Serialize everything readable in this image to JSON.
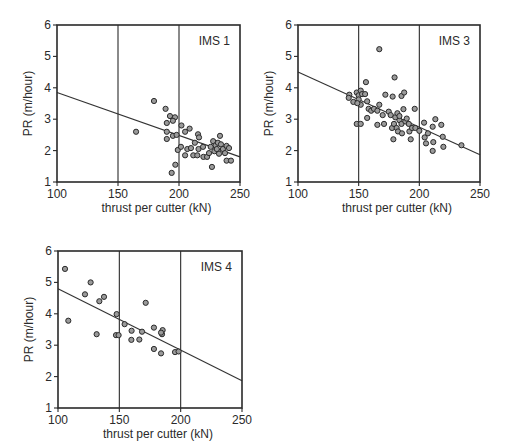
{
  "chart_data": [
    {
      "type": "scatter",
      "title": "IMS 1",
      "xlabel": "thrust per cutter (kN)",
      "ylabel": "PR (m/hour)",
      "xlim": [
        100,
        250
      ],
      "ylim": [
        1,
        6
      ],
      "xticks": [
        100,
        150,
        200,
        250
      ],
      "yticks": [
        1,
        2,
        3,
        4,
        5,
        6
      ],
      "xtick_labels": [
        "100",
        "150",
        "200",
        "250"
      ],
      "ytick_labels": [
        "1",
        "2",
        "3",
        "4",
        "5",
        "6"
      ],
      "vertical_gridlines": [
        150,
        200
      ],
      "label_position": "top-right",
      "regression_line": {
        "x": [
          100,
          250
        ],
        "y": [
          3.85,
          1.8
        ]
      },
      "points": [
        [
          164.8,
          2.6
        ],
        [
          179.5,
          3.58
        ],
        [
          189,
          3.33
        ],
        [
          192.6,
          3.1
        ],
        [
          190,
          2.88
        ],
        [
          196.7,
          3.06
        ],
        [
          195,
          2.95
        ],
        [
          190,
          2.6
        ],
        [
          190,
          2.37
        ],
        [
          195,
          2.47
        ],
        [
          198,
          2.5
        ],
        [
          199,
          2.02
        ],
        [
          201.6,
          2.12
        ],
        [
          202,
          2.8
        ],
        [
          197,
          1.55
        ],
        [
          194,
          1.29
        ],
        [
          205,
          2.6
        ],
        [
          208.7,
          2.7
        ],
        [
          205,
          1.85
        ],
        [
          206.8,
          2.05
        ],
        [
          209.8,
          2.08
        ],
        [
          211.7,
          1.85
        ],
        [
          215,
          1.85
        ],
        [
          213,
          2.25
        ],
        [
          215.6,
          2.52
        ],
        [
          216.4,
          2.42
        ],
        [
          216,
          2.05
        ],
        [
          220,
          1.8
        ],
        [
          223,
          1.8
        ],
        [
          226,
          2.12
        ],
        [
          227,
          1.48
        ],
        [
          228,
          2.3
        ],
        [
          229,
          1.98
        ],
        [
          230,
          2.17
        ],
        [
          231.9,
          2.25
        ],
        [
          232.8,
          1.9
        ],
        [
          233.6,
          2.47
        ],
        [
          234.4,
          2.2
        ],
        [
          231,
          2.05
        ],
        [
          236,
          2.05
        ],
        [
          237.7,
          1.92
        ],
        [
          239,
          2.15
        ],
        [
          241,
          2.08
        ],
        [
          239,
          1.68
        ],
        [
          242.6,
          1.68
        ],
        [
          224.6,
          1.92
        ],
        [
          219.7,
          2.12
        ]
      ]
    },
    {
      "type": "scatter",
      "title": "IMS 3",
      "xlabel": "thrust per cutter (kN)",
      "ylabel": "PR (m/hour)",
      "xlim": [
        100,
        250
      ],
      "ylim": [
        1,
        6
      ],
      "xticks": [
        100,
        150,
        200,
        250
      ],
      "yticks": [
        1,
        2,
        3,
        4,
        5,
        6
      ],
      "xtick_labels": [
        "100",
        "150",
        "200",
        "250"
      ],
      "ytick_labels": [
        "1",
        "2",
        "3",
        "4",
        "5",
        "6"
      ],
      "vertical_gridlines": [
        150,
        200
      ],
      "label_position": "top-right",
      "regression_line": {
        "x": [
          100,
          250
        ],
        "y": [
          4.5,
          1.87
        ]
      },
      "points": [
        [
          167,
          5.23
        ],
        [
          179.6,
          4.33
        ],
        [
          156,
          4.18
        ],
        [
          142.3,
          3.78
        ],
        [
          141.8,
          3.68
        ],
        [
          145.6,
          3.55
        ],
        [
          148.4,
          3.85
        ],
        [
          150,
          3.76
        ],
        [
          151.7,
          3.91
        ],
        [
          152.8,
          3.8
        ],
        [
          150,
          3.63
        ],
        [
          151.7,
          3.46
        ],
        [
          148.9,
          3.51
        ],
        [
          155.3,
          3.8
        ],
        [
          157,
          3.57
        ],
        [
          158.2,
          3.33
        ],
        [
          160.3,
          3.27
        ],
        [
          157,
          3.04
        ],
        [
          148.4,
          2.85
        ],
        [
          151.7,
          2.85
        ],
        [
          162.6,
          3.33
        ],
        [
          165.4,
          3.27
        ],
        [
          165.4,
          2.82
        ],
        [
          167,
          3.46
        ],
        [
          169.8,
          3.13
        ],
        [
          170.9,
          2.85
        ],
        [
          172,
          3.78
        ],
        [
          174.8,
          3.24
        ],
        [
          176.4,
          3.13
        ],
        [
          178,
          3.72
        ],
        [
          177.5,
          2.72
        ],
        [
          178.6,
          2.36
        ],
        [
          179.1,
          2.85
        ],
        [
          180.2,
          3.06
        ],
        [
          181.3,
          2.72
        ],
        [
          182.4,
          2.61
        ],
        [
          181.9,
          3.19
        ],
        [
          183.6,
          2.97
        ],
        [
          185.3,
          2.85
        ],
        [
          185.3,
          3.74
        ],
        [
          187.5,
          3.85
        ],
        [
          186.9,
          3.32
        ],
        [
          183.6,
          3.1
        ],
        [
          185.7,
          2.55
        ],
        [
          188.5,
          2.93
        ],
        [
          189.6,
          3.02
        ],
        [
          191.3,
          2.85
        ],
        [
          191.8,
          2.61
        ],
        [
          192.9,
          2.36
        ],
        [
          194,
          2.72
        ],
        [
          196.2,
          3.33
        ],
        [
          196.7,
          2.72
        ],
        [
          200,
          2.63
        ],
        [
          203.9,
          2.89
        ],
        [
          204.4,
          2.42
        ],
        [
          205.5,
          2.23
        ],
        [
          207.1,
          2.55
        ],
        [
          211,
          2.76
        ],
        [
          211,
          1.99
        ],
        [
          211.5,
          2.27
        ],
        [
          213.2,
          3.0
        ],
        [
          218.1,
          2.82
        ],
        [
          219.3,
          2.44
        ],
        [
          219.8,
          2.12
        ],
        [
          234.7,
          2.17
        ]
      ]
    },
    {
      "type": "scatter",
      "title": "IMS 4",
      "xlabel": "thrust per cutter (kN)",
      "ylabel": "PR (m/hour)",
      "xlim": [
        100,
        250
      ],
      "ylim": [
        1,
        6
      ],
      "xticks": [
        100,
        150,
        200,
        250
      ],
      "yticks": [
        1,
        2,
        3,
        4,
        5,
        6
      ],
      "xtick_labels": [
        "100",
        "150",
        "200",
        "250"
      ],
      "ytick_labels": [
        "1",
        "2",
        "3",
        "4",
        "5",
        "6"
      ],
      "vertical_gridlines": [
        150,
        200
      ],
      "label_position": "top-right",
      "regression_line": {
        "x": [
          100,
          250
        ],
        "y": [
          4.8,
          1.87
        ]
      },
      "points": [
        [
          105.7,
          5.43
        ],
        [
          108.4,
          3.78
        ],
        [
          122,
          4.62
        ],
        [
          126.6,
          5.0
        ],
        [
          133.7,
          4.4
        ],
        [
          137.5,
          4.54
        ],
        [
          131.5,
          3.35
        ],
        [
          147.8,
          3.99
        ],
        [
          147.3,
          3.32
        ],
        [
          149.4,
          3.32
        ],
        [
          154.3,
          3.67
        ],
        [
          160,
          3.46
        ],
        [
          159.8,
          3.17
        ],
        [
          166.3,
          3.18
        ],
        [
          168.5,
          3.43
        ],
        [
          171.5,
          4.35
        ],
        [
          178.2,
          3.56
        ],
        [
          178.2,
          2.88
        ],
        [
          184.8,
          3.35
        ],
        [
          185.3,
          3.48
        ],
        [
          184,
          2.74
        ],
        [
          195.4,
          2.78
        ],
        [
          198.3,
          2.8
        ],
        [
          184,
          3.4
        ]
      ]
    }
  ]
}
